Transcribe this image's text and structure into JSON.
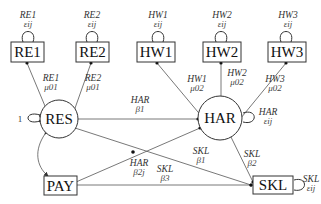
{
  "diagram": {
    "type": "structural-equation-path-diagram",
    "nodes": {
      "RE1": {
        "label": "RE1",
        "shape": "box"
      },
      "RE2": {
        "label": "RE2",
        "shape": "box"
      },
      "HW1": {
        "label": "HW1",
        "shape": "box"
      },
      "HW2": {
        "label": "HW2",
        "shape": "box"
      },
      "HW3": {
        "label": "HW3",
        "shape": "box"
      },
      "RES": {
        "label": "RES",
        "shape": "circle"
      },
      "HAR": {
        "label": "HAR",
        "shape": "circle"
      },
      "PAY": {
        "label": "PAY",
        "shape": "box"
      },
      "SKL": {
        "label": "SKL",
        "shape": "box"
      }
    },
    "error_terms": {
      "RE1": {
        "top": "RE1",
        "sub": "εij"
      },
      "RE2": {
        "top": "RE2",
        "sub": "εij"
      },
      "HW1": {
        "top": "HW1",
        "sub": "εij"
      },
      "HW2": {
        "top": "HW2",
        "sub": "εij"
      },
      "HW3": {
        "top": "HW3",
        "sub": "εij"
      },
      "HAR": {
        "top": "HAR",
        "sub": "εij"
      },
      "SKL": {
        "top": "SKL",
        "sub": "εij"
      },
      "RES": {
        "value": "1"
      }
    },
    "edges": {
      "RES_RE1": {
        "top": "RE1",
        "sub": "μ01"
      },
      "RES_RE2": {
        "top": "RE2",
        "sub": "μ01"
      },
      "HAR_HW1": {
        "top": "HW1",
        "sub": "μ02"
      },
      "HAR_HW2": {
        "top": "HW2",
        "sub": "μ02"
      },
      "HAR_HW3": {
        "top": "HW3",
        "sub": "μ02"
      },
      "RES_HAR": {
        "top": "HAR",
        "sub": "β1"
      },
      "PAY_HAR": {
        "top": "HAR",
        "sub": "β2j"
      },
      "RES_SKL": {
        "top": "SKL",
        "sub": "β1"
      },
      "PAY_SKL": {
        "top": "SKL",
        "sub": "β3"
      },
      "HAR_SKL": {
        "top": "SKL",
        "sub": "β2"
      },
      "RES_PAY": {
        "type": "covariance"
      }
    }
  }
}
